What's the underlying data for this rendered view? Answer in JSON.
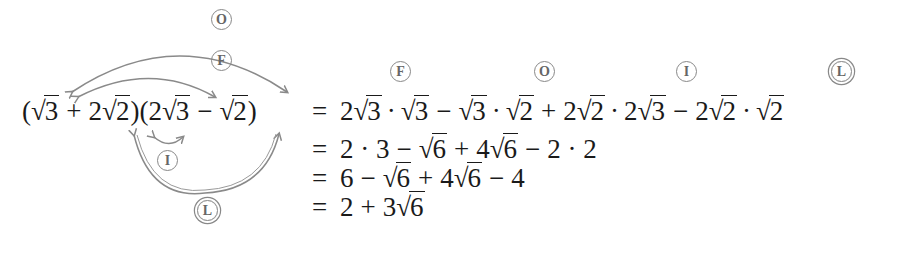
{
  "labels": {
    "first": "F",
    "outer": "O",
    "inner": "I",
    "last": "L"
  },
  "lhs": {
    "open_paren": "(",
    "a_rad": "3",
    "plus": "+",
    "b_coef": "2",
    "b_rad": "2",
    "close_open": ")(",
    "c_coef": "2",
    "c_rad": "3",
    "minus": "−",
    "d_rad": "2",
    "close_paren": ")"
  },
  "steps": [
    {
      "equals": "=",
      "terms": [
        "2",
        "3",
        "·",
        "3",
        "−",
        "3",
        "·",
        "2",
        "+",
        "2",
        "2",
        "·",
        "2",
        "3",
        "−",
        "2",
        "2",
        "·",
        "2"
      ]
    },
    {
      "equals": "=",
      "expr_a": "2 · 3",
      "op1": "−",
      "r1": "6",
      "op2": "+",
      "coef2": "4",
      "r2": "6",
      "op3": "−",
      "expr_b": "2 · 2"
    },
    {
      "equals": "=",
      "a": "6",
      "op1": "−",
      "r1": "6",
      "op2": "+",
      "coef2": "4",
      "r2": "6",
      "op3": "−",
      "b": "4"
    },
    {
      "equals": "=",
      "a": "2",
      "op1": "+",
      "coef": "3",
      "r": "6"
    }
  ],
  "sqrt_symbol": "√",
  "colors": {
    "text": "#1a1a1a",
    "arrow": "#8a8a8a",
    "label": "#666666"
  }
}
